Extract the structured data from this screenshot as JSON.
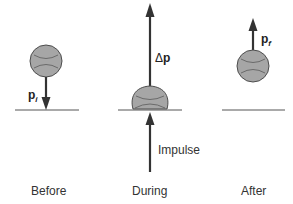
{
  "colors": {
    "ball_fill": "#a6a6a6",
    "ball_stroke": "#4d4d4d",
    "arrow": "#333333",
    "ground": "#555555",
    "text": "#333333"
  },
  "panels": [
    {
      "caption": "Before",
      "vector_label": {
        "symbol": "p",
        "subscript": "i"
      },
      "arrow_direction": "down"
    },
    {
      "caption": "During",
      "vector_label": {
        "prefix": "Δ",
        "symbol": "p"
      },
      "force_label": "Impulse",
      "arrow_direction": "up"
    },
    {
      "caption": "After",
      "vector_label": {
        "symbol": "p",
        "subscript": "f"
      },
      "arrow_direction": "up"
    }
  ]
}
